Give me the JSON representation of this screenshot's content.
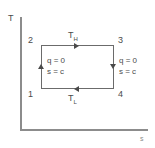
{
  "chart_data": {
    "type": "line",
    "title": "",
    "subtitle": "",
    "xlabel": "s",
    "ylabel": "T",
    "grid": false,
    "legend": null,
    "x": [
      1,
      1,
      2,
      2,
      1
    ],
    "y": [
      1,
      2,
      2,
      1,
      1
    ],
    "series": [
      {
        "name": "Carnot cycle",
        "points": [
          {
            "state": "1",
            "position": "bottom-left"
          },
          {
            "state": "2",
            "position": "top-left"
          },
          {
            "state": "3",
            "position": "top-right"
          },
          {
            "state": "4",
            "position": "bottom-right"
          }
        ]
      }
    ],
    "annotations": [
      {
        "text": "T_H",
        "edge": "top",
        "meaning": "high temperature isotherm"
      },
      {
        "text": "T_L",
        "edge": "bottom",
        "meaning": "low temperature isotherm"
      },
      {
        "text": "q = 0 / s = c",
        "edge": "left",
        "meaning": "isentropic process 1-2"
      },
      {
        "text": "q = 0 / s = c",
        "edge": "right",
        "meaning": "isentropic process 3-4"
      }
    ],
    "process_directions": [
      {
        "from": "1",
        "to": "2",
        "edge": "left",
        "arrow": "up"
      },
      {
        "from": "2",
        "to": "3",
        "edge": "top",
        "arrow": "right"
      },
      {
        "from": "3",
        "to": "4",
        "edge": "right",
        "arrow": "down"
      },
      {
        "from": "4",
        "to": "1",
        "edge": "bottom",
        "arrow": "left"
      }
    ]
  },
  "axes": {
    "y_label": "T",
    "x_label": "s"
  },
  "states": {
    "one": "1",
    "two": "2",
    "three": "3",
    "four": "4"
  },
  "temperatures": {
    "high_base": "T",
    "high_sub": "H",
    "low_base": "T",
    "low_sub": "L"
  },
  "process_notes": {
    "left_line1": "q = 0",
    "left_line2": "s = c",
    "right_line1": "q = 0",
    "right_line2": "s = c"
  },
  "colors": {
    "axis": "#8c8c8c",
    "cycle_line": "#6b6b6b",
    "text": "#4a4a4a",
    "background": "#ffffff"
  }
}
